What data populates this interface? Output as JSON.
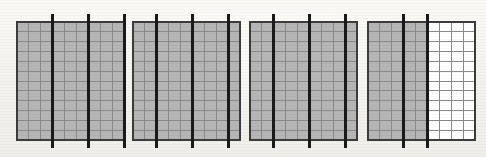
{
  "figure": {
    "title": "Four rectangular grid panels crossed by vertical bars",
    "background_color": "#f7f6f2",
    "canvas": {
      "width": 486,
      "height": 157
    },
    "grid": {
      "columns": 9,
      "rows": 12,
      "cell_fill_shaded": "#b6b6b6",
      "cell_fill_unshaded": "#ffffff",
      "gridline_color": "#8a8a8a",
      "gridline_width": 1,
      "border_color": "#3c3c3c",
      "border_width": 2
    },
    "bars": {
      "color": "#1a1a1a",
      "width": 3,
      "top_y": 14,
      "bottom_y": 148,
      "label": "vertical-bar"
    },
    "panels": [
      {
        "name": "panel-1",
        "index": 1,
        "x": 17,
        "y": 22,
        "width": 107,
        "height": 118,
        "columns": 9,
        "rows": 12,
        "shaded_columns": 9,
        "unshaded_columns": 0,
        "bar_count": 3,
        "bar_columns": [
          3,
          6,
          9
        ]
      },
      {
        "name": "panel-2",
        "index": 2,
        "x": 133,
        "y": 22,
        "width": 107,
        "height": 118,
        "columns": 9,
        "rows": 12,
        "shaded_columns": 9,
        "unshaded_columns": 0,
        "bar_count": 3,
        "bar_columns": [
          2,
          5,
          8
        ]
      },
      {
        "name": "panel-3",
        "index": 3,
        "x": 250,
        "y": 22,
        "width": 107,
        "height": 118,
        "columns": 9,
        "rows": 12,
        "shaded_columns": 9,
        "unshaded_columns": 0,
        "bar_count": 3,
        "bar_columns": [
          2,
          5,
          8
        ]
      },
      {
        "name": "panel-4",
        "index": 4,
        "x": 368,
        "y": 22,
        "width": 107,
        "height": 118,
        "columns": 9,
        "rows": 12,
        "shaded_columns": 5,
        "unshaded_columns": 4,
        "bar_count": 2,
        "bar_columns": [
          3,
          5
        ]
      }
    ]
  }
}
